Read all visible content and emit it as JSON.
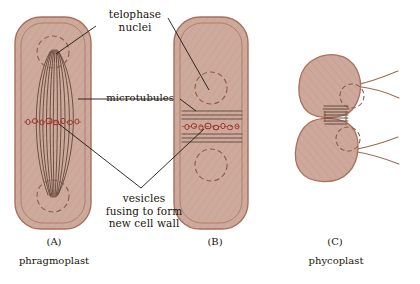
{
  "figure": {
    "background_color": "#ffffff",
    "cell_fill": "#ceaa9d",
    "cell_fill_light": "#d8b7aa",
    "cell_outline": "#a9705c",
    "line_color": "#5a4032",
    "vesicle_color": "#a03c2e",
    "text_color": "#1a1208",
    "leader_color": "#1c1610"
  },
  "labels": {
    "telophase_nuclei": "telophase\nnuclei",
    "microtubules": "microtubules",
    "vesicles": "vesicles\nfusing to form\nnew cell wall"
  },
  "captions": {
    "panel_a": "(A)",
    "panel_a_name": "phragmoplast",
    "panel_b": "(B)",
    "panel_c": "(C)",
    "panel_c_name": "phycoplast"
  },
  "panels": [
    {
      "id": "A",
      "letter": "(A)",
      "name": "phragmoplast",
      "shape": "elongated rounded rectangle cell",
      "nuclei": 2,
      "microtubule_arrangement": "spindle-shaped longitudinal bundle between poles",
      "microtubule_count": 10,
      "vesicle_row": "equatorial horizontal row of vesicles"
    },
    {
      "id": "B",
      "letter": "(B)",
      "name": "",
      "shape": "elongated rounded rectangle cell",
      "nuclei": 2,
      "microtubule_arrangement": "transverse horizontal lines at cell equator",
      "microtubule_count": 6,
      "vesicle_row": "equatorial horizontal row of vesicles"
    },
    {
      "id": "C",
      "letter": "(C)",
      "name": "phycoplast",
      "shape": "two rounded lobes joined at constricted waist, flagella at right",
      "nuclei": 2,
      "microtubule_arrangement": "transverse horizontal lines across the constricted waist",
      "microtubule_count": 7,
      "flagella": 4
    }
  ]
}
